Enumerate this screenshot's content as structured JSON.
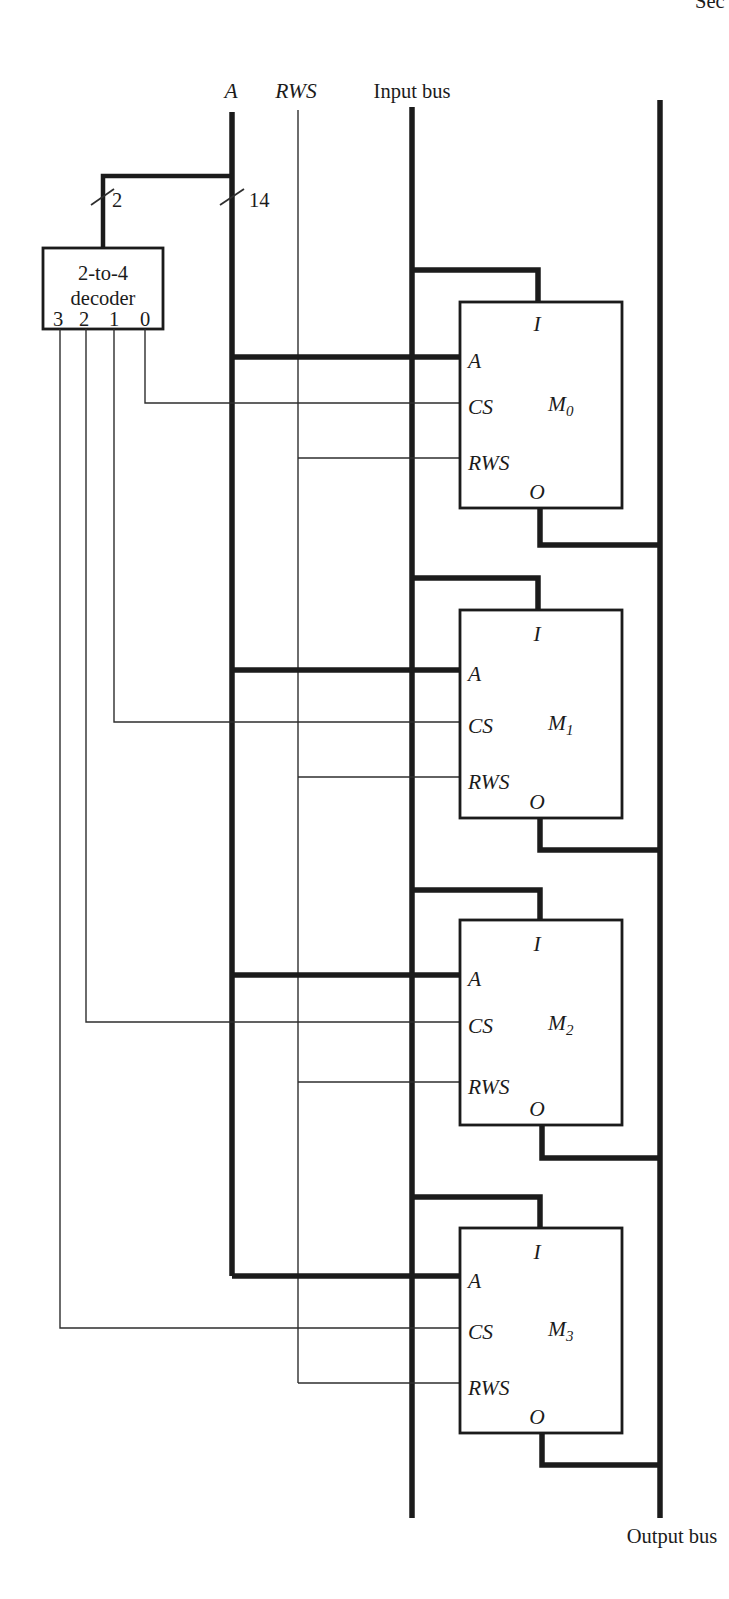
{
  "page": {
    "header_fragment": "Sec"
  },
  "colors": {
    "ink": "#1b1b1b",
    "paper": "#ffffff"
  },
  "bus_labels": {
    "address": "A",
    "read_write_select": "RWS",
    "input_bus": "Input bus",
    "output_bus": "Output bus"
  },
  "bus_width_annotations": {
    "decoder_input_bits": "2",
    "address_bits": "14"
  },
  "decoder": {
    "title_line1": "2-to-4",
    "title_line2": "decoder",
    "outputs": [
      "3",
      "2",
      "1",
      "0"
    ]
  },
  "modules": [
    {
      "name": "M",
      "subscript": "0",
      "ports": {
        "input": "I",
        "address": "A",
        "chip_select": "CS",
        "read_write_select": "RWS",
        "output": "O"
      }
    },
    {
      "name": "M",
      "subscript": "1",
      "ports": {
        "input": "I",
        "address": "A",
        "chip_select": "CS",
        "read_write_select": "RWS",
        "output": "O"
      }
    },
    {
      "name": "M",
      "subscript": "2",
      "ports": {
        "input": "I",
        "address": "A",
        "chip_select": "CS",
        "read_write_select": "RWS",
        "output": "O"
      }
    },
    {
      "name": "M",
      "subscript": "3",
      "ports": {
        "input": "I",
        "address": "A",
        "chip_select": "CS",
        "read_write_select": "RWS",
        "output": "O"
      }
    }
  ]
}
